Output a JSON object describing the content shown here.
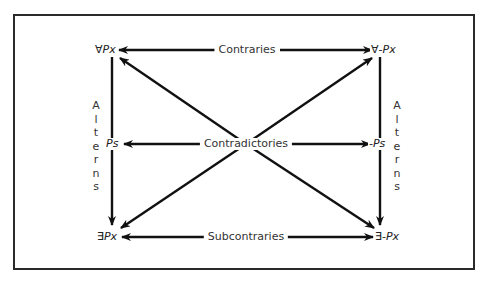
{
  "diagram": {
    "type": "square-of-opposition",
    "nodes": {
      "top_left": {
        "quant": "∀",
        "neg": "",
        "pred": "Px"
      },
      "top_right": {
        "quant": "∀",
        "neg": "-",
        "pred": "Px"
      },
      "mid_left": {
        "quant": "",
        "neg": "",
        "pred": "Ps"
      },
      "mid_right": {
        "quant": "",
        "neg": "-",
        "pred": "Ps"
      },
      "bottom_left": {
        "quant": "∃",
        "neg": "",
        "pred": "Px"
      },
      "bottom_right": {
        "quant": "∃",
        "neg": "-",
        "pred": "Px"
      }
    },
    "relations": {
      "top": "Contraries",
      "middle": "Contradictories",
      "bottom": "Subcontraries",
      "left_side": [
        "A",
        "l",
        "t",
        "e",
        "r",
        "n",
        "s"
      ],
      "right_side": [
        "A",
        "l",
        "t",
        "e",
        "r",
        "n",
        "s"
      ]
    },
    "colors": {
      "line": "#111111",
      "frame": "#2a2a2a",
      "text": "#333333"
    }
  }
}
